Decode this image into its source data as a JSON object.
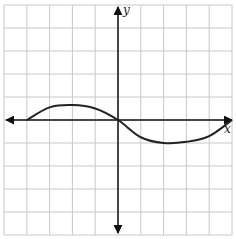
{
  "chart_data": {
    "type": "line",
    "title": "",
    "xlabel": "x",
    "ylabel": "y",
    "xlim": [
      -5,
      5
    ],
    "ylim": [
      -5,
      5
    ],
    "grid": true,
    "tick_labels_shown": false,
    "series": [
      {
        "name": "curve",
        "x": [
          -4,
          -3,
          -2,
          -1,
          0,
          1,
          2,
          3,
          4,
          5
        ],
        "y": [
          0,
          0.55,
          0.65,
          0.5,
          0,
          -0.75,
          -1.0,
          -0.95,
          -0.7,
          0
        ]
      }
    ]
  },
  "labels": {
    "x_axis": "x",
    "y_axis": "y"
  },
  "colors": {
    "grid": "#c8c8c8",
    "axis": "#111111",
    "curve": "#222222"
  }
}
